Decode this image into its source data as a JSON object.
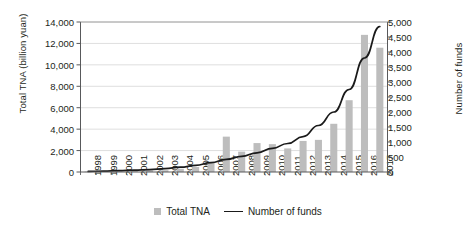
{
  "chart_data": {
    "type": "bar",
    "title": "",
    "xlabel": "",
    "ylabel": "Total TNA (billion yuan)",
    "y2label": "Number of funds",
    "grid": true,
    "legend_position": "bottom-center",
    "categories": [
      "1998",
      "1999",
      "2000",
      "2001",
      "2002",
      "2003",
      "2004",
      "2005",
      "2006",
      "2007",
      "2008",
      "2009",
      "2010",
      "2011",
      "2012",
      "2013",
      "2014",
      "2015",
      "2016",
      "2017"
    ],
    "ylim": [
      0,
      14000
    ],
    "yticks": [
      "0",
      "2,000",
      "4,000",
      "6,000",
      "8,000",
      "10,000",
      "12,000",
      "14,000"
    ],
    "ytick_values": [
      0,
      2000,
      4000,
      6000,
      8000,
      10000,
      12000,
      14000
    ],
    "y2lim": [
      0,
      5000
    ],
    "y2ticks": [
      "0",
      "500",
      "1,000",
      "1,500",
      "2,000",
      "2,500",
      "3,000",
      "3,500",
      "4,000",
      "4,500",
      "5,000"
    ],
    "y2tick_values": [
      0,
      500,
      1000,
      1500,
      2000,
      2500,
      3000,
      3500,
      4000,
      4500,
      5000
    ],
    "series": [
      {
        "name": "Total TNA",
        "type": "bar",
        "axis": "left",
        "color": "#bdbdbd",
        "values": [
          40,
          60,
          85,
          110,
          140,
          170,
          300,
          470,
          860,
          3300,
          1900,
          2700,
          2600,
          2200,
          2900,
          3000,
          4500,
          6700,
          12800,
          11600
        ]
      },
      {
        "name": "Number of funds",
        "type": "line",
        "axis": "right",
        "color": "#1a1a1a",
        "values": [
          20,
          30,
          45,
          60,
          80,
          110,
          160,
          220,
          310,
          420,
          520,
          640,
          790,
          950,
          1180,
          1550,
          2000,
          2750,
          3800,
          4850
        ]
      }
    ]
  },
  "legend": {
    "bar_label": "Total TNA",
    "line_label": "Number of funds"
  }
}
